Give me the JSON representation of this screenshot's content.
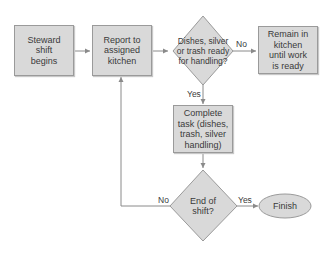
{
  "diagram": {
    "type": "flowchart",
    "colors": {
      "fill": "#d9d9d9",
      "stroke": "#9a9a9a",
      "text": "#3a3a3a",
      "connector": "#8a8a8a"
    },
    "nodes": [
      {
        "id": "start",
        "shape": "rectangle",
        "label": "Steward shift begins",
        "lines": [
          "Steward",
          "shift",
          "begins"
        ]
      },
      {
        "id": "report",
        "shape": "rectangle",
        "label": "Report to assigned kitchen",
        "lines": [
          "Report to",
          "assigned",
          "kitchen"
        ]
      },
      {
        "id": "ready",
        "shape": "diamond",
        "label": "Dishes, silver or trash ready for handling?",
        "lines": [
          "Dishes,",
          "silver or trash",
          "ready for",
          "handling?"
        ]
      },
      {
        "id": "remain",
        "shape": "rectangle",
        "label": "Remain in kitchen until work is ready",
        "lines": [
          "Remain in",
          "kitchen",
          "until work",
          "is ready"
        ]
      },
      {
        "id": "complete",
        "shape": "rectangle",
        "label": "Complete task (dishes, trash, silver handling)",
        "lines": [
          "Complete",
          "task (dishes,",
          "trash, silver",
          "handling)"
        ]
      },
      {
        "id": "end",
        "shape": "diamond",
        "label": "End of shift?",
        "lines": [
          "End of",
          "shift?"
        ]
      },
      {
        "id": "finish",
        "shape": "ellipse",
        "label": "Finish",
        "lines": [
          "Finish"
        ]
      }
    ],
    "edges": [
      {
        "from": "start",
        "to": "report",
        "label": ""
      },
      {
        "from": "report",
        "to": "ready",
        "label": ""
      },
      {
        "from": "ready",
        "to": "remain",
        "label": "No"
      },
      {
        "from": "ready",
        "to": "complete",
        "label": "Yes"
      },
      {
        "from": "complete",
        "to": "end",
        "label": ""
      },
      {
        "from": "end",
        "to": "report",
        "label": "No"
      },
      {
        "from": "end",
        "to": "finish",
        "label": "Yes"
      }
    ]
  }
}
